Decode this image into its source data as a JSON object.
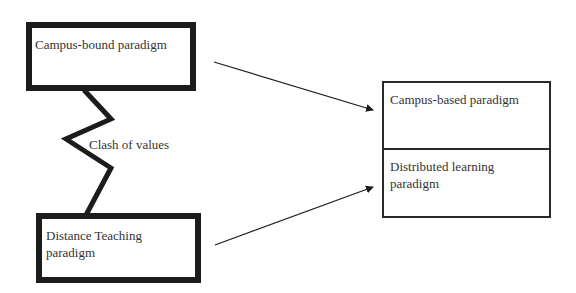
{
  "diagram": {
    "boxes": {
      "campus_bound": {
        "label": "Campus-bound paradigm"
      },
      "distance_teaching": {
        "label_line1": "Distance Teaching",
        "label_line2": "paradigm"
      },
      "right_group": {
        "top": {
          "label": "Campus-based paradigm"
        },
        "bottom": {
          "label_line1": "Distributed learning",
          "label_line2": "paradigm"
        }
      }
    },
    "connector": {
      "label": "Clash of values",
      "style": "zigzag"
    },
    "arrows": [
      {
        "from": "Campus-bound paradigm",
        "to": "Campus-based paradigm"
      },
      {
        "from": "Distance Teaching paradigm",
        "to": "Distributed learning paradigm"
      }
    ],
    "colors": {
      "line": "#1c1c1c",
      "text": "#333333",
      "background": "#ffffff"
    }
  }
}
